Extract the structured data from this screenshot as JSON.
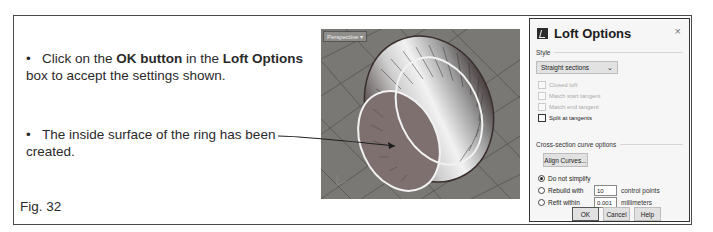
{
  "instructions": {
    "bullet1": {
      "pre": "Click on the ",
      "bold1": "OK button",
      "mid": " in the ",
      "bold2": "Loft Options",
      "post": " box to accept the settings shown."
    },
    "bullet2": {
      "text": "The inside surface of the ring has been created."
    },
    "bullet_glyph": "•",
    "figure_label": "Fig. 32"
  },
  "viewport": {
    "label": "Perspective",
    "dropdown_glyph": "▾",
    "colors": {
      "background": "#7a7875",
      "grid": "#5b5956",
      "ring_curves": "#f2f2f2"
    }
  },
  "dialog": {
    "title": "Loft Options",
    "close_glyph": "×",
    "style_section": "Style",
    "style_select": {
      "value": "Straight sections",
      "chevron": "⌄"
    },
    "checkboxes": [
      {
        "label": "Closed loft",
        "checked": false,
        "enabled": false
      },
      {
        "label": "Match start tangent",
        "checked": false,
        "enabled": false
      },
      {
        "label": "Match end tangent",
        "checked": false,
        "enabled": false
      },
      {
        "label": "Split at tangents",
        "checked": false,
        "enabled": true
      }
    ],
    "cross_section_section": "Cross-section curve options",
    "align_button": "Align Curves...",
    "radios": [
      {
        "label": "Do not simplify",
        "selected": true
      },
      {
        "label": "Rebuild with",
        "selected": false,
        "value": "10",
        "unit": "control points"
      },
      {
        "label": "Refit within",
        "selected": false,
        "value": "0.001",
        "unit": "millimeters"
      }
    ],
    "buttons": {
      "ok": "OK",
      "cancel": "Cancel",
      "help": "Help"
    }
  }
}
